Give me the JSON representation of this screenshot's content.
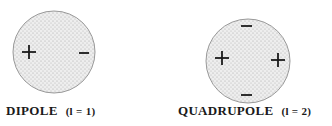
{
  "diagrams": [
    {
      "name": "dipole",
      "label": "DIPOLE",
      "order": "(l = 1)",
      "charges": [
        {
          "sign": "+",
          "x": 28,
          "y": 52
        },
        {
          "sign": "−",
          "x": 83,
          "y": 53
        }
      ]
    },
    {
      "name": "quadrupole",
      "label": "QUADRUPOLE",
      "order": "(l = 2)",
      "charges": [
        {
          "sign": "−",
          "x": 246,
          "y": 26
        },
        {
          "sign": "+",
          "x": 221,
          "y": 58
        },
        {
          "sign": "+",
          "x": 278,
          "y": 60
        },
        {
          "sign": "−",
          "x": 246,
          "y": 94
        }
      ]
    }
  ],
  "colors": {
    "fill": "#e6e6e6",
    "stroke": "#9a9a9a",
    "ink": "#1a1a1a"
  }
}
